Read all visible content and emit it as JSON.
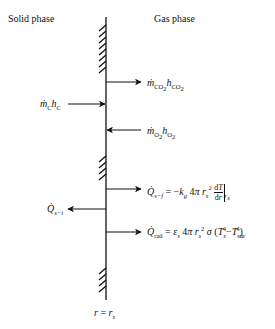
{
  "diagram": {
    "title_left": "Solid phase",
    "title_right": "Gas phase",
    "wall_label": "r = r_s",
    "wall": {
      "x": 106,
      "y_top": 17,
      "y_bottom": 300
    },
    "hatch_groups": [
      {
        "y_start": 25,
        "y_end": 72
      },
      {
        "y_start": 155,
        "y_end": 181
      },
      {
        "y_start": 267,
        "y_end": 292
      }
    ],
    "fluxes": [
      {
        "id": "co2",
        "direction": "out-right",
        "y": 82,
        "label": "ṁ_CO2 h_CO2"
      },
      {
        "id": "carbon",
        "direction": "in-from-left",
        "y": 104,
        "label": "ṁ_C h_C"
      },
      {
        "id": "o2",
        "direction": "in-from-right",
        "y": 130,
        "label": "ṁ_O2 h_O2"
      },
      {
        "id": "q-s-f",
        "direction": "out-right",
        "y": 189,
        "label": "Q̇_s−f = −k_g 4π r_s² dT/dr |_rs"
      },
      {
        "id": "q-s-i",
        "direction": "out-left",
        "y": 209,
        "label": "Q̇_s−i"
      },
      {
        "id": "q-rad",
        "direction": "out-right",
        "y": 232,
        "label": "Q̇_rad = ε_s 4π r_s² σ (T_s⁴ − T_sur⁴)"
      }
    ],
    "colors": {
      "line": "#111111",
      "background": "#ffffff"
    }
  }
}
